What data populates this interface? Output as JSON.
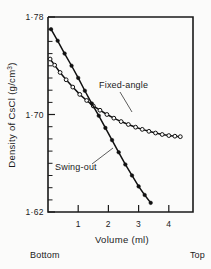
{
  "chart_data": {
    "type": "line",
    "title": "",
    "xlabel": "Volume (ml)",
    "ylabel": "Density of CsCl (g/cm3)",
    "ylabel_main": "Density of CsCl (g/cm",
    "ylabel_sup": "3",
    "ylabel_close": ")",
    "xlim": [
      0,
      4.8
    ],
    "ylim": [
      1.62,
      1.78
    ],
    "xticks": [
      1,
      2,
      3,
      4
    ],
    "xtick_labels": [
      "1",
      "2",
      "3",
      "4"
    ],
    "yticks": [
      1.62,
      1.7,
      1.78
    ],
    "ytick_labels": [
      "1·62",
      "1·70",
      "1·78"
    ],
    "y_minor_step": 0.01,
    "grid": false,
    "legend_position": "inline-annotation",
    "axis_end_labels": {
      "left": "Bottom",
      "right": "Top"
    },
    "series": [
      {
        "name": "Fixed-angle",
        "label": "Fixed-angle",
        "marker": "open-circle",
        "x": [
          0.07,
          0.22,
          0.4,
          0.6,
          0.82,
          1.05,
          1.28,
          1.5,
          1.72,
          1.95,
          2.18,
          2.42,
          2.66,
          2.9,
          3.12,
          3.34,
          3.56,
          3.78,
          4.0,
          4.2,
          4.38
        ],
        "y": [
          1.7455,
          1.7405,
          1.7345,
          1.7285,
          1.7225,
          1.7165,
          1.7115,
          1.707,
          1.7035,
          1.7,
          1.697,
          1.6942,
          1.6918,
          1.6896,
          1.6878,
          1.6862,
          1.6848,
          1.6836,
          1.6827,
          1.6822,
          1.6818
        ]
      },
      {
        "name": "Swing-out",
        "label": "Swing-out",
        "marker": "filled-circle",
        "x": [
          0.1,
          0.32,
          0.55,
          0.78,
          1.0,
          1.22,
          1.45,
          1.68,
          1.9,
          2.12,
          2.34,
          2.56,
          2.78,
          3.0,
          3.2,
          3.4
        ],
        "y": [
          1.77,
          1.7605,
          1.75,
          1.74,
          1.73,
          1.7195,
          1.709,
          1.699,
          1.689,
          1.679,
          1.669,
          1.659,
          1.65,
          1.641,
          1.634,
          1.6275
        ]
      }
    ],
    "annotations": [
      {
        "name": "fixed-angle-annotation",
        "text": "Fixed-angle",
        "text_x": 99,
        "text_y": 88,
        "leader_from": [
          120,
          92
        ],
        "leader_to": [
          132,
          112
        ]
      },
      {
        "name": "swing-out-annotation",
        "text": "Swing-out",
        "text_x": 55,
        "text_y": 170,
        "leader_from": [
          92,
          164
        ],
        "leader_to": [
          113,
          148
        ]
      }
    ]
  },
  "plot_geometry": {
    "left": 48,
    "right": 193,
    "top": 17,
    "bottom": 212
  }
}
